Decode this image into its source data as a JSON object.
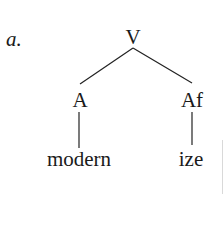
{
  "example": {
    "label": "a."
  },
  "tree": {
    "root": {
      "label": "V"
    },
    "children": [
      {
        "label": "A",
        "leaf": "modern"
      },
      {
        "label": "Af",
        "leaf": "ize"
      }
    ]
  }
}
